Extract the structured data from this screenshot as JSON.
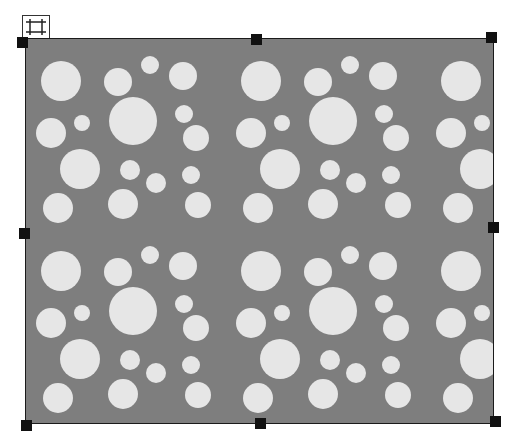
{
  "canvas": {
    "object_type": "image-frame",
    "pattern": "polka-dot",
    "background_color": "#7e7e7e",
    "dot_color": "#e6e6e6",
    "border_color": "#1a1a1a",
    "handle_color": "#111111",
    "tile": {
      "width": 200,
      "height": 190,
      "dots": [
        [
          35,
          42,
          20
        ],
        [
          92,
          43,
          14
        ],
        [
          124,
          26,
          9
        ],
        [
          157,
          37,
          14
        ],
        [
          107,
          82,
          24
        ],
        [
          158,
          75,
          9
        ],
        [
          25,
          94,
          15
        ],
        [
          56,
          84,
          8
        ],
        [
          170,
          99,
          13
        ],
        [
          54,
          130,
          20
        ],
        [
          104,
          131,
          10
        ],
        [
          130,
          144,
          10
        ],
        [
          165,
          136,
          9
        ],
        [
          32,
          169,
          15
        ],
        [
          97,
          165,
          15
        ],
        [
          172,
          166,
          13
        ]
      ]
    }
  },
  "icons": {
    "move_handle": "move-frame-icon"
  },
  "handles": [
    "top-left",
    "top-center",
    "top-right",
    "middle-left",
    "middle-right",
    "bottom-left",
    "bottom-center",
    "bottom-right"
  ]
}
